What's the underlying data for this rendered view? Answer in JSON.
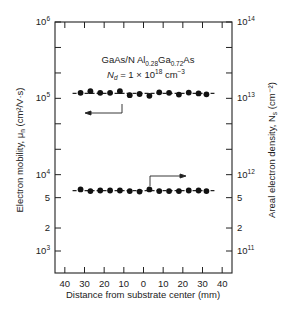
{
  "chart_data": {
    "type": "scatter",
    "title": "",
    "annotation_line1": {
      "base": "GaAs/N Al",
      "sub1": "0.28",
      "mid": "Ga",
      "sub2": "0.72",
      "end": "As"
    },
    "annotation_line2": {
      "sym": "N",
      "symsub": "d",
      "text": " = 1 × 10",
      "sup": "18",
      "unit": " cm",
      "unitsup": "−3"
    },
    "xlabel": "Distance from substrate center (mm)",
    "ylabel_left": "Electron mobility, μ",
    "ylabel_left_sub": "n",
    "ylabel_left_unit": " (cm²/V·s)",
    "ylabel_right": "Areal electron density, N",
    "ylabel_right_sub": "s",
    "ylabel_right_unit": " (cm⁻²)",
    "x_ticks": [
      "40",
      "30",
      "20",
      "10",
      "0",
      "10",
      "20",
      "30",
      "40"
    ],
    "xlim": [
      -45,
      45
    ],
    "ylim_left": [
      500,
      1000000
    ],
    "ylim_right": [
      50000000000,
      100000000000000
    ],
    "yscale": "log",
    "left_tick_labels": [
      {
        "value": 1000000,
        "label": "10",
        "sup": "6"
      },
      {
        "value": 100000,
        "label": "10",
        "sup": "5"
      },
      {
        "value": 10000,
        "label": "10",
        "sup": "4"
      },
      {
        "value": 5000,
        "label": "5",
        "sup": ""
      },
      {
        "value": 2000,
        "label": "2",
        "sup": ""
      },
      {
        "value": 1000,
        "label": "10",
        "sup": "3"
      }
    ],
    "right_tick_labels": [
      {
        "value": 100000000000000,
        "label": "10",
        "sup": "14"
      },
      {
        "value": 10000000000000,
        "label": "10",
        "sup": "13"
      },
      {
        "value": 1000000000000,
        "label": "10",
        "sup": "12"
      },
      {
        "value": 500000000000,
        "label": "5",
        "sup": ""
      },
      {
        "value": 200000000000,
        "label": "2",
        "sup": ""
      },
      {
        "value": 100000000000,
        "label": "10",
        "sup": "11"
      }
    ],
    "series": [
      {
        "name": "Electron mobility",
        "axis": "left",
        "x": [
          -32,
          -27,
          -22,
          -17,
          -12,
          -7,
          -2,
          3,
          8,
          13,
          18,
          23,
          28,
          32
        ],
        "values": [
          118000,
          124000,
          118000,
          118000,
          124000,
          110000,
          114000,
          108000,
          120000,
          118000,
          112000,
          119000,
          116000,
          113000
        ]
      },
      {
        "name": "Areal electron density",
        "axis": "right",
        "x": [
          -32,
          -27,
          -22,
          -17,
          -12,
          -7,
          -2,
          3,
          8,
          13,
          18,
          23,
          28,
          32
        ],
        "values": [
          640000000000,
          610000000000,
          620000000000,
          620000000000,
          620000000000,
          610000000000,
          600000000000,
          640000000000,
          610000000000,
          610000000000,
          610000000000,
          620000000000,
          620000000000,
          610000000000
        ]
      }
    ],
    "grid": false,
    "legend": "arrows pointing to respective axes"
  }
}
